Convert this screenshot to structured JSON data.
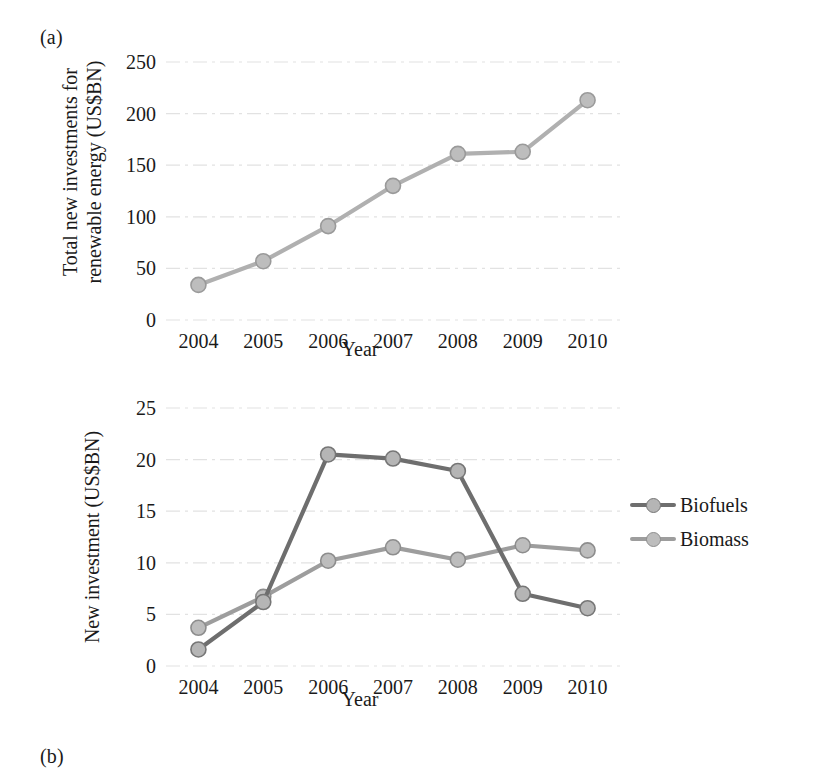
{
  "figure": {
    "background": "#ffffff",
    "panels": [
      {
        "label": "(a)"
      },
      {
        "label": "(b)"
      }
    ]
  },
  "chart_data": [
    {
      "type": "line",
      "panel": "(a)",
      "title": "",
      "xlabel": "Year",
      "ylabel": "Total new investments for renewable energy (US$BN)",
      "ylabel_line1": "Total new investments for",
      "ylabel_line2": "renewable energy (US$BN)",
      "categories": [
        "2004",
        "2005",
        "2006",
        "2007",
        "2008",
        "2009",
        "2010"
      ],
      "xticklabels": [
        "2004",
        "2005",
        "2006",
        "2007",
        "2008",
        "2009",
        "2010"
      ],
      "yticklabels": [
        "0",
        "50",
        "100",
        "150",
        "200",
        "250"
      ],
      "yticks": [
        0,
        50,
        100,
        150,
        200,
        250
      ],
      "ylim": [
        0,
        250
      ],
      "grid": "horizontal",
      "legend": "none",
      "series": [
        {
          "name": "Total new investments",
          "color": "#b0b0b0",
          "marker_face": "#bdbdbd",
          "marker_edge": "#9a9a9a",
          "values": [
            34,
            57,
            91,
            130,
            161,
            163,
            213
          ]
        }
      ]
    },
    {
      "type": "line",
      "panel": "(b)",
      "title": "",
      "xlabel": "Year",
      "ylabel": "New investment (US$BN)",
      "categories": [
        "2004",
        "2005",
        "2006",
        "2007",
        "2008",
        "2009",
        "2010"
      ],
      "xticklabels": [
        "2004",
        "2005",
        "2006",
        "2007",
        "2008",
        "2009",
        "2010"
      ],
      "yticklabels": [
        "0",
        "5",
        "10",
        "15",
        "20",
        "25"
      ],
      "yticks": [
        0,
        5,
        10,
        15,
        20,
        25
      ],
      "ylim": [
        0,
        25
      ],
      "grid": "horizontal",
      "legend_position": "right",
      "series": [
        {
          "name": "Biofuels",
          "color": "#6e6e6e",
          "marker_face": "#b5b5b5",
          "marker_edge": "#767676",
          "values": [
            1.6,
            6.2,
            20.5,
            20.1,
            18.9,
            7.0,
            5.6
          ]
        },
        {
          "name": "Biomass",
          "color": "#9d9d9d",
          "marker_face": "#bdbdbd",
          "marker_edge": "#8d8d8d",
          "values": [
            3.7,
            6.7,
            10.2,
            11.5,
            10.3,
            11.7,
            11.2
          ]
        }
      ]
    }
  ]
}
